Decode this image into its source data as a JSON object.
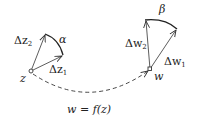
{
  "diagram": {
    "left": {
      "point_label": "z",
      "vector1_label": "Δz",
      "vector1_sub": "1",
      "vector2_label": "Δz",
      "vector2_sub": "2",
      "angle_label": "α"
    },
    "right": {
      "point_label": "w",
      "vector1_label": "Δw",
      "vector1_sub": "1",
      "vector2_label": "Δw",
      "vector2_sub": "2",
      "angle_label": "β"
    },
    "mapping_label": "w = f(z)",
    "colors": {
      "stroke": "#333333",
      "background": "#ffffff"
    }
  }
}
